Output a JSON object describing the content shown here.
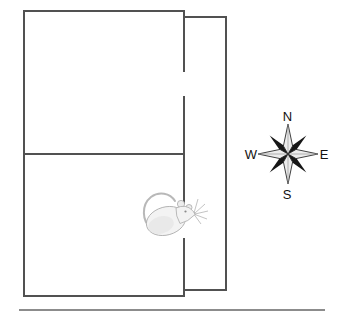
{
  "scene": {
    "background_color": "#ffffff",
    "wall_color": "#515151",
    "ground_line_color": "#8c8c8c"
  },
  "compass": {
    "labels": {
      "north": "N",
      "east": "E",
      "south": "S",
      "west": "W"
    },
    "colors": {
      "cardinal_point_fill": "#ececec",
      "intercardinal_point_fill": "#161616",
      "outline": "#2a2a2a",
      "label_text": "#111111"
    }
  },
  "icons": [
    {
      "name": "rat-icon"
    },
    {
      "name": "compass-rose-icon"
    }
  ]
}
